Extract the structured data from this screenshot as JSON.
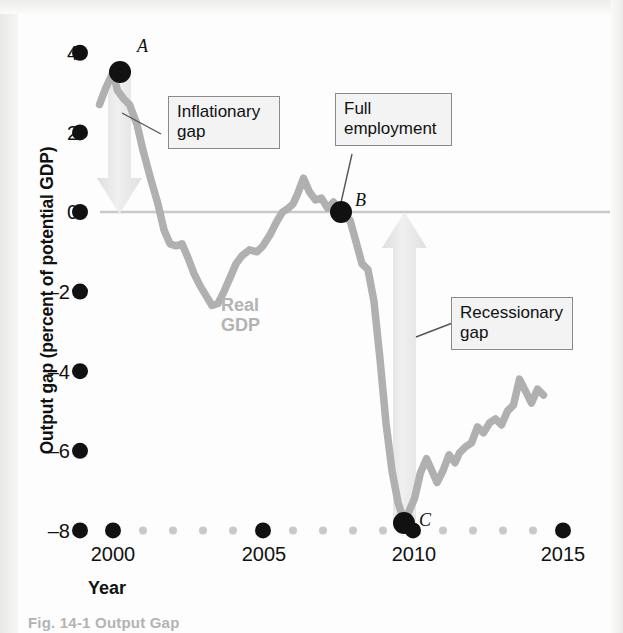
{
  "figure": {
    "caption_fragment": "Fig. 14-1  Output Gap"
  },
  "axes": {
    "y_title": "Output gap (percent of potential GDP)",
    "x_title": "Year",
    "y_ticks": [
      "4",
      "2",
      "0",
      "–2",
      "–4",
      "–6",
      "–8"
    ],
    "y_tick_values": [
      4,
      2,
      0,
      -2,
      -4,
      -6,
      -8
    ],
    "x_ticks": [
      "2000",
      "2005",
      "2010",
      "2015"
    ],
    "x_tick_values": [
      2000,
      2005,
      2010,
      2015
    ],
    "x_minor_values": [
      2001,
      2002,
      2003,
      2004,
      2006,
      2007,
      2008,
      2009,
      2011,
      2012,
      2013,
      2014
    ]
  },
  "annotations": {
    "inflationary_gap": "Inflationary\ngap",
    "inflationary_gap_line1": "Inflationary",
    "inflationary_gap_line2": "gap",
    "full_employment_line1": "Full",
    "full_employment_line2": "employment",
    "recessionary_gap_line1": "Recessionary",
    "recessionary_gap_line2": "gap",
    "series_label_line1": "Real",
    "series_label_line2": "GDP"
  },
  "points": {
    "a_label": "A",
    "b_label": "B",
    "c_label": "C"
  },
  "colors": {
    "line": "#b0b0b0",
    "zero_line": "#c9c9c9",
    "arrow_fill": "#e6e6e6",
    "marker": "#111111",
    "callout_bg": "#f3f3f3",
    "callout_border": "#8a8a8a",
    "minor_tick": "#c9c9c9"
  },
  "chart_data": {
    "type": "line",
    "title": "",
    "xlabel": "Year",
    "ylabel": "Output gap (percent of potential GDP)",
    "xlim": [
      1999.3,
      2014.6
    ],
    "ylim": [
      -8,
      4.6
    ],
    "grid": false,
    "legend": "inline-label",
    "zero_reference_line": 0,
    "series": [
      {
        "name": "Real GDP",
        "x": [
          1999.55,
          1999.75,
          2000.0,
          2000.15,
          2000.35,
          2000.55,
          2000.8,
          2001.0,
          2001.25,
          2001.5,
          2001.7,
          2001.9,
          2002.1,
          2002.3,
          2002.5,
          2002.7,
          2002.9,
          2003.1,
          2003.3,
          2003.5,
          2003.7,
          2003.9,
          2004.1,
          2004.3,
          2004.55,
          2004.8,
          2005.0,
          2005.25,
          2005.45,
          2005.65,
          2005.85,
          2006.0,
          2006.15,
          2006.35,
          2006.55,
          2006.75,
          2006.95,
          2007.15,
          2007.35,
          2007.55,
          2007.7,
          2007.9,
          2008.1,
          2008.3,
          2008.5,
          2008.7,
          2008.9,
          2009.1,
          2009.3,
          2009.5,
          2009.7,
          2009.85,
          2010.05,
          2010.25,
          2010.45,
          2010.6,
          2010.8,
          2011.0,
          2011.2,
          2011.4,
          2011.55,
          2011.75,
          2011.95,
          2012.15,
          2012.35,
          2012.55,
          2012.75,
          2012.95,
          2013.15,
          2013.35,
          2013.55,
          2013.75,
          2013.95,
          2014.15,
          2014.35
        ],
        "y": [
          2.7,
          3.1,
          3.5,
          3.05,
          2.85,
          2.7,
          2.2,
          1.55,
          0.85,
          0.2,
          -0.45,
          -0.8,
          -0.85,
          -0.8,
          -1.15,
          -1.55,
          -1.85,
          -2.1,
          -2.35,
          -2.3,
          -2.0,
          -1.65,
          -1.3,
          -1.1,
          -0.95,
          -1.0,
          -0.85,
          -0.55,
          -0.25,
          0.0,
          0.1,
          0.2,
          0.45,
          0.85,
          0.5,
          0.3,
          0.35,
          0.1,
          0.25,
          0.0,
          -0.15,
          -0.2,
          -0.75,
          -1.3,
          -1.45,
          -2.25,
          -3.7,
          -5.3,
          -6.5,
          -7.3,
          -7.75,
          -7.55,
          -7.2,
          -6.55,
          -6.2,
          -6.45,
          -6.8,
          -6.5,
          -6.1,
          -6.3,
          -6.05,
          -5.9,
          -5.8,
          -5.4,
          -5.55,
          -5.3,
          -5.2,
          -5.35,
          -5.0,
          -4.85,
          -4.2,
          -4.5,
          -4.8,
          -4.45,
          -4.6
        ]
      }
    ],
    "markers": [
      {
        "label": "A",
        "x": 2000.0,
        "y": 3.5,
        "note": "Inflationary gap"
      },
      {
        "label": "B",
        "x": 2007.55,
        "y": 0.0,
        "note": "Full employment"
      },
      {
        "label": "C",
        "x": 2009.7,
        "y": -7.8,
        "note": "Recessionary gap"
      }
    ],
    "arrows": [
      {
        "name": "inflationary-gap-arrow",
        "x": 2000.0,
        "y_from": 3.5,
        "y_to": 0.0,
        "direction": "down"
      },
      {
        "name": "recessionary-gap-arrow",
        "x": 2009.7,
        "y_from": -7.8,
        "y_to": 0.0,
        "direction": "up"
      }
    ]
  }
}
